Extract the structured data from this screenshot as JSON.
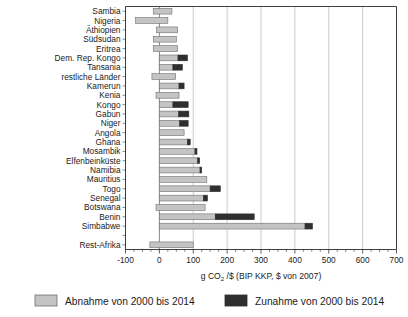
{
  "chart_data": {
    "type": "bar",
    "orientation": "horizontal",
    "stacked": true,
    "title": "",
    "xlabel": "g CO2 /$ (BIP KKP, $ von 2007)",
    "xlabel_parts": {
      "pre": "g CO",
      "sub": "2",
      "post": " /$ (BIP KKP, $ von 2007)"
    },
    "ylabel": "",
    "xlim": [
      -100,
      700
    ],
    "xticks": [
      -100,
      0,
      100,
      200,
      300,
      400,
      500,
      600,
      700
    ],
    "xtick_labels": [
      "-100",
      "0",
      "100",
      "200",
      "300",
      "400",
      "500",
      "600",
      "700"
    ],
    "minor_tick_step": 25,
    "grid": "vertical",
    "legend_position": "bottom",
    "categories": [
      "Sambia",
      "Nigeria",
      "Äthiopien",
      "Südsudan",
      "Eritrea",
      "Dem. Rep. Kongo",
      "Tansania",
      "restliche Länder",
      "Kamerun",
      "Kenia",
      "Kongo",
      "Gabun",
      "Niger",
      "Angola",
      "Ghana",
      "Mosambik",
      "Elfenbeinküste",
      "Namibia",
      "Mauritius",
      "Togo",
      "Senegal",
      "Botswana",
      "Benin",
      "Simbabwe",
      "",
      "Rest-Afrika"
    ],
    "series": [
      {
        "name": "Abnahme von 2000 bis 2014",
        "color": "#c4c4c4",
        "values": [
          55,
          95,
          62,
          68,
          72,
          55,
          40,
          70,
          58,
          68,
          40,
          57,
          60,
          73,
          83,
          105,
          113,
          120,
          140,
          150,
          130,
          145,
          165,
          430,
          null,
          75
        ]
      },
      {
        "name": "Zunahme von 2000 bis 2014",
        "color": "#2f2f2f",
        "values": [
          0,
          0,
          0,
          0,
          0,
          28,
          28,
          0,
          15,
          0,
          45,
          30,
          25,
          0,
          8,
          6,
          6,
          5,
          0,
          30,
          12,
          0,
          115,
          22,
          null,
          0
        ]
      }
    ],
    "bars": [
      {
        "label": "Sambia",
        "start": -18,
        "dec": 55,
        "inc": 0,
        "total": 37
      },
      {
        "label": "Nigeria",
        "start": -70,
        "dec": 95,
        "inc": 0,
        "total": 25
      },
      {
        "label": "Äthiopien",
        "start": -8,
        "dec": 62,
        "inc": 0,
        "total": 54
      },
      {
        "label": "Südsudan",
        "start": -18,
        "dec": 68,
        "inc": 0,
        "total": 50
      },
      {
        "label": "Eritrea",
        "start": -18,
        "dec": 72,
        "inc": 0,
        "total": 54
      },
      {
        "label": "Dem. Rep. Kongo",
        "start": 0,
        "dec": 55,
        "inc": 28,
        "total": 83
      },
      {
        "label": "Tansania",
        "start": 0,
        "dec": 40,
        "inc": 28,
        "total": 68
      },
      {
        "label": "restliche Länder",
        "start": -22,
        "dec": 70,
        "inc": 0,
        "total": 48
      },
      {
        "label": "Kamerun",
        "start": 0,
        "dec": 58,
        "inc": 15,
        "total": 73
      },
      {
        "label": "Kenia",
        "start": -10,
        "dec": 68,
        "inc": 0,
        "total": 58
      },
      {
        "label": "Kongo",
        "start": 0,
        "dec": 40,
        "inc": 45,
        "total": 85
      },
      {
        "label": "Gabun",
        "start": 0,
        "dec": 57,
        "inc": 30,
        "total": 87
      },
      {
        "label": "Niger",
        "start": 0,
        "dec": 60,
        "inc": 25,
        "total": 85
      },
      {
        "label": "Angola",
        "start": 0,
        "dec": 73,
        "inc": 0,
        "total": 73
      },
      {
        "label": "Ghana",
        "start": 0,
        "dec": 83,
        "inc": 8,
        "total": 91
      },
      {
        "label": "Mosambik",
        "start": 0,
        "dec": 105,
        "inc": 6,
        "total": 111
      },
      {
        "label": "Elfenbeinküste",
        "start": 0,
        "dec": 113,
        "inc": 6,
        "total": 119
      },
      {
        "label": "Namibia",
        "start": 0,
        "dec": 120,
        "inc": 5,
        "total": 125
      },
      {
        "label": "Mauritius",
        "start": 0,
        "dec": 140,
        "inc": 0,
        "total": 140
      },
      {
        "label": "Togo",
        "start": 0,
        "dec": 150,
        "inc": 30,
        "total": 180
      },
      {
        "label": "Senegal",
        "start": 0,
        "dec": 130,
        "inc": 12,
        "total": 142
      },
      {
        "label": "Botswana",
        "start": -10,
        "dec": 145,
        "inc": 0,
        "total": 135
      },
      {
        "label": "Benin",
        "start": 0,
        "dec": 165,
        "inc": 115,
        "total": 280
      },
      {
        "label": "Simbabwe",
        "start": 0,
        "dec": 430,
        "inc": 22,
        "total": 452
      },
      {
        "label": "",
        "start": 0,
        "dec": 0,
        "inc": 0,
        "total": 0
      },
      {
        "label": "Rest-Afrika",
        "start": -28,
        "dec": 128,
        "inc": 0,
        "total": 100
      }
    ],
    "legend": [
      {
        "label": "Abnahme von 2000 bis 2014",
        "color": "#c4c4c4"
      },
      {
        "label": "Zunahme von 2000 bis 2014",
        "color": "#2f2f2f"
      }
    ]
  }
}
